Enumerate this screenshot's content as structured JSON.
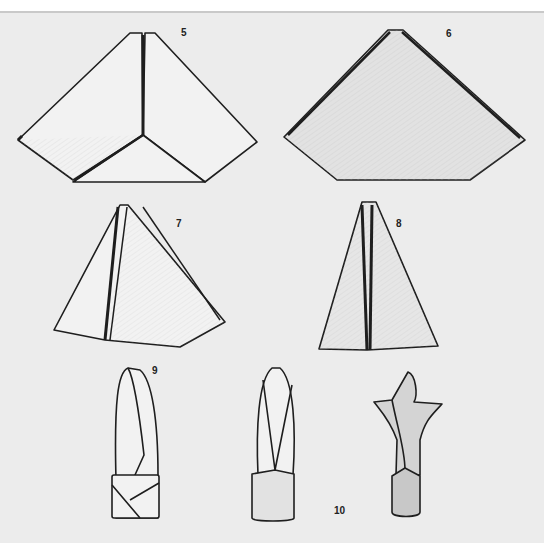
{
  "illustration": {
    "subject": "napkin folding steps",
    "background_color": "#ececec",
    "ink_color": "#1e1e1e",
    "fill_light": "#f1f1f1",
    "fill_shade": "#d8d8d8",
    "fill_dark": "#c4c4c4"
  },
  "steps": [
    {
      "number": "5",
      "x": 181,
      "y": 32
    },
    {
      "number": "6",
      "x": 446,
      "y": 32
    },
    {
      "number": "7",
      "x": 176,
      "y": 222
    },
    {
      "number": "8",
      "x": 396,
      "y": 222
    },
    {
      "number": "9",
      "x": 152,
      "y": 365
    },
    {
      "number": "10",
      "x": 336,
      "y": 505
    }
  ]
}
